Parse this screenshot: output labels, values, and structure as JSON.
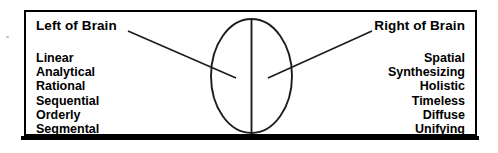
{
  "diagram": {
    "type": "labeled-illustration",
    "colors": {
      "stroke": "#000000",
      "background": "#ffffff",
      "text": "#000000"
    },
    "frame": {
      "border_color": "#000000",
      "shadow_color": "#000000"
    },
    "brain": {
      "shape": "ellipse",
      "divider": "vertical-midline",
      "left_hemisphere_label_ref": "left.heading",
      "right_hemisphere_label_ref": "right.heading"
    },
    "left": {
      "heading": "Left of Brain",
      "traits": [
        "Linear",
        "Analytical",
        "Rational",
        "Sequential",
        "Orderly",
        "Segmental"
      ]
    },
    "right": {
      "heading": "Right of Brain",
      "traits": [
        "Spatial",
        "Synthesizing",
        "Holistic",
        "Timeless",
        "Diffuse",
        "Unifying"
      ]
    }
  }
}
